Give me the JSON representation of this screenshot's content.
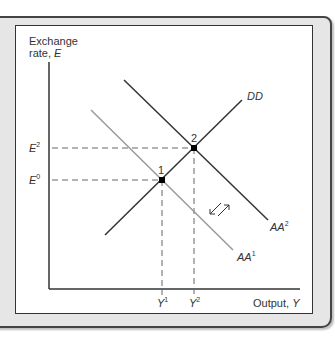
{
  "diagram": {
    "y_axis_label_line1": "Exchange",
    "y_axis_label_line2": "rate, ",
    "y_axis_var": "E",
    "x_axis_label": "Output, ",
    "x_axis_var": "Y",
    "curves": [
      {
        "name": "DD",
        "label": "DD",
        "sup": "",
        "color": "#333333"
      },
      {
        "name": "AA2",
        "label": "AA",
        "sup": "2",
        "color": "#333333"
      },
      {
        "name": "AA1",
        "label": "AA",
        "sup": "1",
        "color": "#999999"
      }
    ],
    "points": [
      {
        "label": "1",
        "x_label": "Y",
        "x_sup": "1",
        "y_label": "E",
        "y_sup": "0"
      },
      {
        "label": "2",
        "x_label": "Y",
        "x_sup": "2",
        "y_label": "E",
        "y_sup": "2"
      }
    ],
    "shift_arrows": "AA shifts right from AA1 to AA2"
  }
}
